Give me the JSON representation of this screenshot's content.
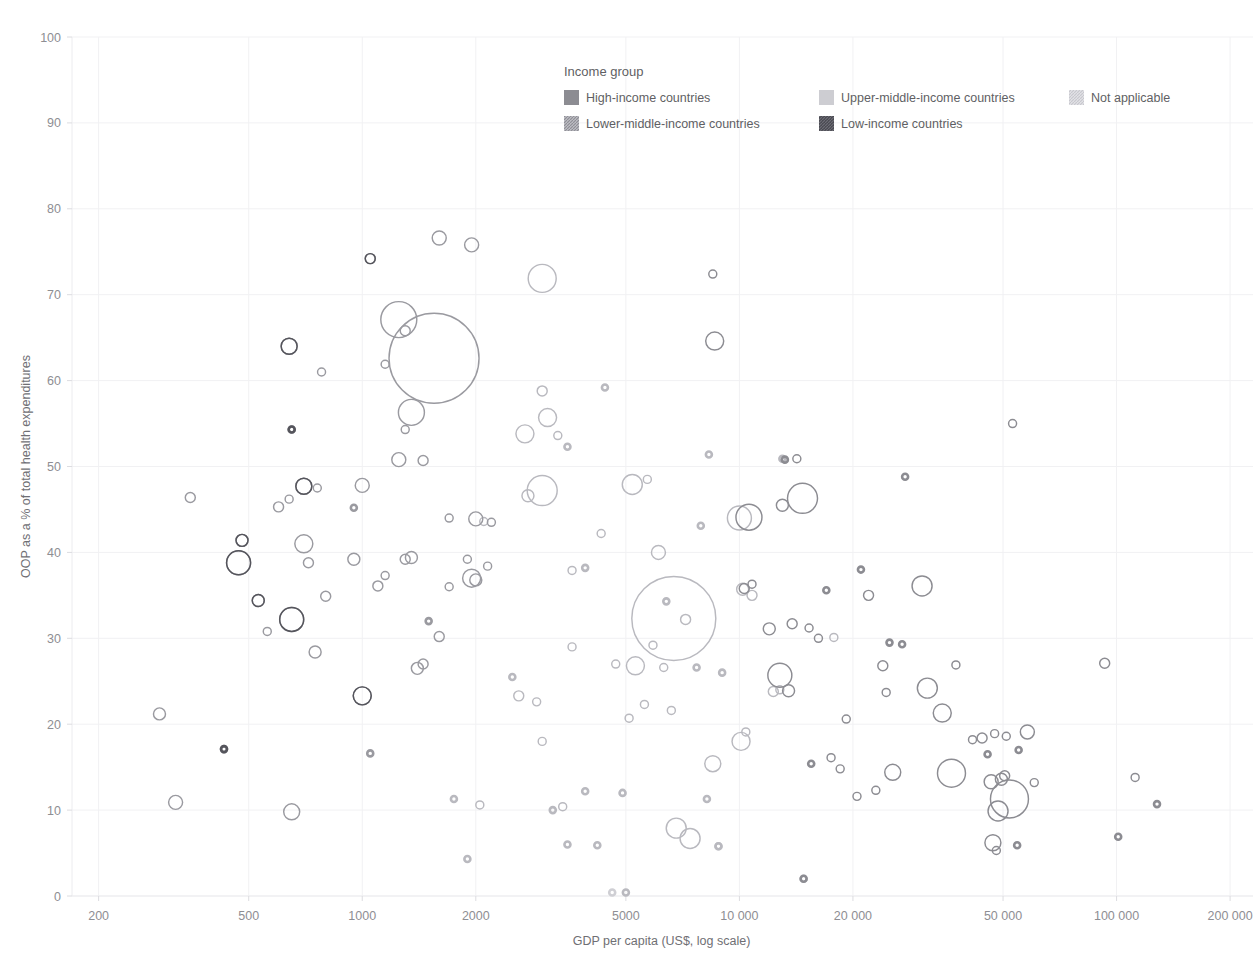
{
  "chart_data": {
    "type": "scatter",
    "title": "",
    "xlabel": "GDP per capita (US$, log scale)",
    "ylabel": "OOP as a % of total health expenditures",
    "xscale": "log",
    "xlim": [
      170,
      230000
    ],
    "ylim": [
      0,
      100
    ],
    "grid": true,
    "legend_position": "top-center",
    "xticks": [
      200,
      500,
      1000,
      2000,
      5000,
      10000,
      20000,
      50000,
      100000,
      200000
    ],
    "xticklabels": [
      "200",
      "500",
      "1000",
      "2000",
      "5000",
      "10 000",
      "20 000",
      "50 000",
      "100 000",
      "200 000"
    ],
    "yticks": [
      0,
      10,
      20,
      30,
      40,
      50,
      60,
      70,
      80,
      90,
      100
    ],
    "yticklabels": [
      "0",
      "10",
      "20",
      "30",
      "40",
      "50",
      "60",
      "70",
      "80",
      "90",
      "100"
    ],
    "size_encoding": "population",
    "color_encoding": "income group (stroke darkness)",
    "series": [
      {
        "name": "High-income countries",
        "color": "#8c8c92",
        "points": [
          {
            "x": 53000,
            "y": 55.0,
            "r": 4
          },
          {
            "x": 14700,
            "y": 46.3,
            "r": 15
          },
          {
            "x": 10600,
            "y": 44.1,
            "r": 13
          },
          {
            "x": 13000,
            "y": 45.5,
            "r": 6
          },
          {
            "x": 8600,
            "y": 64.6,
            "r": 9
          },
          {
            "x": 8500,
            "y": 72.4,
            "r": 4
          },
          {
            "x": 12800,
            "y": 25.7,
            "r": 12
          },
          {
            "x": 30500,
            "y": 36.1,
            "r": 10
          },
          {
            "x": 27500,
            "y": 48.8,
            "r": 3
          },
          {
            "x": 14200,
            "y": 50.9,
            "r": 4
          },
          {
            "x": 31500,
            "y": 24.2,
            "r": 10
          },
          {
            "x": 34500,
            "y": 21.3,
            "r": 9
          },
          {
            "x": 36500,
            "y": 14.3,
            "r": 14
          },
          {
            "x": 52000,
            "y": 11.3,
            "r": 19
          },
          {
            "x": 48500,
            "y": 9.9,
            "r": 10
          },
          {
            "x": 46500,
            "y": 13.3,
            "r": 7
          },
          {
            "x": 49500,
            "y": 13.6,
            "r": 6
          },
          {
            "x": 50500,
            "y": 14.0,
            "r": 5
          },
          {
            "x": 47000,
            "y": 6.2,
            "r": 8
          },
          {
            "x": 58000,
            "y": 19.1,
            "r": 7
          },
          {
            "x": 44000,
            "y": 18.4,
            "r": 5
          },
          {
            "x": 47500,
            "y": 18.9,
            "r": 4
          },
          {
            "x": 51000,
            "y": 18.6,
            "r": 4
          },
          {
            "x": 55000,
            "y": 17.0,
            "r": 3
          },
          {
            "x": 45500,
            "y": 16.5,
            "r": 3
          },
          {
            "x": 41500,
            "y": 18.2,
            "r": 4
          },
          {
            "x": 60500,
            "y": 13.2,
            "r": 4
          },
          {
            "x": 48000,
            "y": 5.3,
            "r": 4
          },
          {
            "x": 54500,
            "y": 5.9,
            "r": 3
          },
          {
            "x": 93000,
            "y": 27.1,
            "r": 5
          },
          {
            "x": 112000,
            "y": 13.8,
            "r": 4
          },
          {
            "x": 128000,
            "y": 10.7,
            "r": 3
          },
          {
            "x": 101000,
            "y": 6.9,
            "r": 3
          },
          {
            "x": 37500,
            "y": 26.9,
            "r": 4
          },
          {
            "x": 24000,
            "y": 26.8,
            "r": 5
          },
          {
            "x": 24500,
            "y": 23.7,
            "r": 4
          },
          {
            "x": 22000,
            "y": 35.0,
            "r": 5
          },
          {
            "x": 21000,
            "y": 38.0,
            "r": 3
          },
          {
            "x": 25500,
            "y": 14.4,
            "r": 8
          },
          {
            "x": 23000,
            "y": 12.3,
            "r": 4
          },
          {
            "x": 27000,
            "y": 29.3,
            "r": 3
          },
          {
            "x": 25000,
            "y": 29.5,
            "r": 3
          },
          {
            "x": 13500,
            "y": 23.9,
            "r": 6
          },
          {
            "x": 14800,
            "y": 2.0,
            "r": 3
          },
          {
            "x": 12000,
            "y": 31.1,
            "r": 6
          },
          {
            "x": 13800,
            "y": 31.7,
            "r": 5
          },
          {
            "x": 15300,
            "y": 31.2,
            "r": 4
          },
          {
            "x": 16200,
            "y": 30.0,
            "r": 4
          },
          {
            "x": 10300,
            "y": 35.8,
            "r": 5
          },
          {
            "x": 10800,
            "y": 36.3,
            "r": 4
          },
          {
            "x": 17000,
            "y": 35.6,
            "r": 3
          },
          {
            "x": 19200,
            "y": 20.6,
            "r": 4
          },
          {
            "x": 17500,
            "y": 16.1,
            "r": 4
          },
          {
            "x": 18500,
            "y": 14.8,
            "r": 4
          },
          {
            "x": 20500,
            "y": 11.6,
            "r": 4
          },
          {
            "x": 15500,
            "y": 15.4,
            "r": 3
          },
          {
            "x": 13200,
            "y": 50.8,
            "r": 3
          }
        ]
      },
      {
        "name": "Upper-middle-income countries",
        "color": "#b9b9bf",
        "points": [
          {
            "x": 6700,
            "y": 32.3,
            "r": 42
          },
          {
            "x": 7200,
            "y": 32.2,
            "r": 5
          },
          {
            "x": 6400,
            "y": 34.3,
            "r": 3
          },
          {
            "x": 5200,
            "y": 47.9,
            "r": 10
          },
          {
            "x": 5700,
            "y": 48.5,
            "r": 4
          },
          {
            "x": 6100,
            "y": 40.0,
            "r": 7
          },
          {
            "x": 8300,
            "y": 51.4,
            "r": 3
          },
          {
            "x": 4400,
            "y": 59.2,
            "r": 3
          },
          {
            "x": 7900,
            "y": 43.1,
            "r": 3
          },
          {
            "x": 10000,
            "y": 44.0,
            "r": 12
          },
          {
            "x": 10200,
            "y": 35.7,
            "r": 6
          },
          {
            "x": 10800,
            "y": 35.0,
            "r": 5
          },
          {
            "x": 5900,
            "y": 29.2,
            "r": 4
          },
          {
            "x": 6300,
            "y": 26.6,
            "r": 4
          },
          {
            "x": 5300,
            "y": 26.8,
            "r": 9
          },
          {
            "x": 5600,
            "y": 22.3,
            "r": 4
          },
          {
            "x": 6600,
            "y": 21.6,
            "r": 4
          },
          {
            "x": 5100,
            "y": 20.7,
            "r": 4
          },
          {
            "x": 6800,
            "y": 7.9,
            "r": 10
          },
          {
            "x": 7400,
            "y": 6.7,
            "r": 10
          },
          {
            "x": 8500,
            "y": 15.4,
            "r": 8
          },
          {
            "x": 10100,
            "y": 18.0,
            "r": 9
          },
          {
            "x": 10400,
            "y": 19.1,
            "r": 4
          },
          {
            "x": 4900,
            "y": 12.0,
            "r": 3
          },
          {
            "x": 8200,
            "y": 11.3,
            "r": 3
          },
          {
            "x": 5000,
            "y": 0.4,
            "r": 3
          },
          {
            "x": 8800,
            "y": 5.8,
            "r": 3
          },
          {
            "x": 7700,
            "y": 26.6,
            "r": 3
          },
          {
            "x": 4700,
            "y": 27.0,
            "r": 4
          },
          {
            "x": 4300,
            "y": 42.2,
            "r": 4
          },
          {
            "x": 3600,
            "y": 37.9,
            "r": 4
          },
          {
            "x": 3900,
            "y": 38.2,
            "r": 3
          },
          {
            "x": 3000,
            "y": 71.9,
            "r": 14
          },
          {
            "x": 3100,
            "y": 55.7,
            "r": 9
          },
          {
            "x": 3300,
            "y": 53.6,
            "r": 4
          },
          {
            "x": 3000,
            "y": 58.8,
            "r": 5
          },
          {
            "x": 3500,
            "y": 52.3,
            "r": 3
          },
          {
            "x": 2700,
            "y": 53.8,
            "r": 9
          },
          {
            "x": 3000,
            "y": 47.2,
            "r": 15
          },
          {
            "x": 2750,
            "y": 46.6,
            "r": 6
          },
          {
            "x": 2100,
            "y": 43.6,
            "r": 4
          },
          {
            "x": 2600,
            "y": 23.3,
            "r": 5
          },
          {
            "x": 2900,
            "y": 22.6,
            "r": 4
          },
          {
            "x": 2500,
            "y": 25.5,
            "r": 3
          },
          {
            "x": 3000,
            "y": 18.0,
            "r": 4
          },
          {
            "x": 3600,
            "y": 29.0,
            "r": 4
          },
          {
            "x": 3400,
            "y": 10.4,
            "r": 4
          },
          {
            "x": 3900,
            "y": 12.2,
            "r": 3
          },
          {
            "x": 3200,
            "y": 10.0,
            "r": 3
          },
          {
            "x": 3500,
            "y": 6.0,
            "r": 3
          },
          {
            "x": 4200,
            "y": 5.9,
            "r": 3
          },
          {
            "x": 2050,
            "y": 10.6,
            "r": 4
          },
          {
            "x": 1750,
            "y": 11.3,
            "r": 3
          },
          {
            "x": 1900,
            "y": 4.3,
            "r": 3
          },
          {
            "x": 12300,
            "y": 23.8,
            "r": 5
          },
          {
            "x": 12800,
            "y": 24.0,
            "r": 4
          },
          {
            "x": 17800,
            "y": 30.1,
            "r": 4
          },
          {
            "x": 9000,
            "y": 26.0,
            "r": 3
          },
          {
            "x": 13000,
            "y": 50.9,
            "r": 3
          }
        ]
      },
      {
        "name": "Lower-middle-income countries",
        "color": "#9a9aa0",
        "points": [
          {
            "x": 1550,
            "y": 62.6,
            "r": 45
          },
          {
            "x": 1250,
            "y": 67.1,
            "r": 18
          },
          {
            "x": 1300,
            "y": 65.8,
            "r": 5
          },
          {
            "x": 1600,
            "y": 76.6,
            "r": 7
          },
          {
            "x": 1950,
            "y": 75.8,
            "r": 7
          },
          {
            "x": 1050,
            "y": 74.2,
            "r": 5
          },
          {
            "x": 1350,
            "y": 56.3,
            "r": 13
          },
          {
            "x": 1150,
            "y": 61.9,
            "r": 4
          },
          {
            "x": 1300,
            "y": 54.3,
            "r": 4
          },
          {
            "x": 1250,
            "y": 50.8,
            "r": 7
          },
          {
            "x": 1450,
            "y": 50.7,
            "r": 5
          },
          {
            "x": 1000,
            "y": 47.8,
            "r": 7
          },
          {
            "x": 1700,
            "y": 44.0,
            "r": 4
          },
          {
            "x": 2000,
            "y": 43.9,
            "r": 7
          },
          {
            "x": 2200,
            "y": 43.5,
            "r": 4
          },
          {
            "x": 950,
            "y": 45.2,
            "r": 3
          },
          {
            "x": 1950,
            "y": 37.0,
            "r": 9
          },
          {
            "x": 2000,
            "y": 36.8,
            "r": 6
          },
          {
            "x": 2150,
            "y": 38.4,
            "r": 4
          },
          {
            "x": 1900,
            "y": 39.2,
            "r": 4
          },
          {
            "x": 1700,
            "y": 36.0,
            "r": 4
          },
          {
            "x": 1350,
            "y": 39.4,
            "r": 6
          },
          {
            "x": 1300,
            "y": 39.2,
            "r": 5
          },
          {
            "x": 1150,
            "y": 37.3,
            "r": 4
          },
          {
            "x": 1100,
            "y": 36.1,
            "r": 5
          },
          {
            "x": 950,
            "y": 39.2,
            "r": 6
          },
          {
            "x": 1600,
            "y": 30.2,
            "r": 5
          },
          {
            "x": 1400,
            "y": 26.5,
            "r": 6
          },
          {
            "x": 1450,
            "y": 27.0,
            "r": 5
          },
          {
            "x": 1000,
            "y": 23.3,
            "r": 9
          },
          {
            "x": 1050,
            "y": 16.6,
            "r": 3
          },
          {
            "x": 800,
            "y": 34.9,
            "r": 5
          },
          {
            "x": 750,
            "y": 28.4,
            "r": 6
          },
          {
            "x": 700,
            "y": 41.0,
            "r": 9
          },
          {
            "x": 720,
            "y": 38.8,
            "r": 5
          },
          {
            "x": 700,
            "y": 47.7,
            "r": 8
          },
          {
            "x": 760,
            "y": 47.5,
            "r": 4
          },
          {
            "x": 640,
            "y": 46.2,
            "r": 4
          },
          {
            "x": 600,
            "y": 45.3,
            "r": 5
          },
          {
            "x": 780,
            "y": 61.0,
            "r": 4
          },
          {
            "x": 640,
            "y": 64.0,
            "r": 8
          },
          {
            "x": 650,
            "y": 54.3,
            "r": 3
          },
          {
            "x": 650,
            "y": 32.2,
            "r": 12
          },
          {
            "x": 560,
            "y": 30.8,
            "r": 4
          },
          {
            "x": 530,
            "y": 34.4,
            "r": 6
          },
          {
            "x": 480,
            "y": 41.4,
            "r": 6
          },
          {
            "x": 470,
            "y": 38.8,
            "r": 12
          },
          {
            "x": 350,
            "y": 46.4,
            "r": 5
          },
          {
            "x": 430,
            "y": 17.1,
            "r": 3
          },
          {
            "x": 650,
            "y": 9.8,
            "r": 8
          },
          {
            "x": 320,
            "y": 10.9,
            "r": 7
          },
          {
            "x": 290,
            "y": 21.2,
            "r": 6
          },
          {
            "x": 1500,
            "y": 32.0,
            "r": 3
          }
        ]
      },
      {
        "name": "Low-income countries",
        "color": "#55555c",
        "points": [
          {
            "x": 1050,
            "y": 74.2,
            "r": 5
          },
          {
            "x": 640,
            "y": 64.0,
            "r": 8
          },
          {
            "x": 650,
            "y": 54.3,
            "r": 3
          },
          {
            "x": 470,
            "y": 38.8,
            "r": 12
          },
          {
            "x": 480,
            "y": 41.4,
            "r": 6
          },
          {
            "x": 530,
            "y": 34.4,
            "r": 6
          },
          {
            "x": 430,
            "y": 17.1,
            "r": 3
          },
          {
            "x": 1000,
            "y": 23.3,
            "r": 9
          },
          {
            "x": 700,
            "y": 47.7,
            "r": 8
          },
          {
            "x": 650,
            "y": 32.2,
            "r": 12
          }
        ]
      },
      {
        "name": "Not applicable",
        "color": "#cfcfd4",
        "points": [
          {
            "x": 4600,
            "y": 0.4,
            "r": 3
          },
          {
            "x": 8800,
            "y": 5.8,
            "r": 3
          },
          {
            "x": 14800,
            "y": 2.0,
            "r": 3
          }
        ]
      }
    ]
  },
  "legend": {
    "title": "Income group",
    "items": [
      {
        "label": "High-income countries",
        "swatch": "#8c8c92",
        "pattern": "solid"
      },
      {
        "label": "Upper-middle-income countries",
        "swatch": "#cdcdd2",
        "pattern": "solid"
      },
      {
        "label": "Not applicable",
        "swatch": "#d9d9de",
        "pattern": "hatch"
      },
      {
        "label": "Lower-middle-income countries",
        "swatch": "#aaaab0",
        "pattern": "hatch"
      },
      {
        "label": "Low-income countries",
        "swatch": "#58585f",
        "pattern": "hatch"
      }
    ]
  }
}
